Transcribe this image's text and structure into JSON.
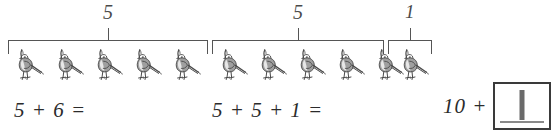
{
  "page": {
    "kind": "math-worksheet",
    "background_color": "#ffffff",
    "ink_color": "#3a3a3a"
  },
  "groups": [
    {
      "label": "5",
      "count": 5,
      "bracket": {
        "left": 8,
        "right": 208,
        "top": 40
      },
      "label_pos": {
        "x": 108,
        "y": 4
      }
    },
    {
      "label": "5",
      "count": 5,
      "bracket": {
        "left": 212,
        "right": 384,
        "top": 40
      },
      "label_pos": {
        "x": 298,
        "y": 4
      }
    },
    {
      "label": "1",
      "count": 1,
      "bracket": {
        "left": 388,
        "right": 431,
        "top": 40
      },
      "label_pos": {
        "x": 410,
        "y": 4
      }
    }
  ],
  "birds": {
    "icon": "quail-bird-icon",
    "total": 11,
    "body_color": "#8e8e8e",
    "outline_color": "#4a4a4a",
    "positions_x": [
      10,
      50,
      89,
      128,
      167,
      214,
      253,
      292,
      331,
      370,
      395
    ],
    "position_y": 48
  },
  "equations": [
    {
      "text": "5 + 6 =",
      "x": 14,
      "y": 100
    },
    {
      "text": "5 + 5 + 1 =",
      "x": 212,
      "y": 100
    },
    {
      "prefix": "10 +",
      "x": 443,
      "y": 84,
      "answer_value": "1",
      "answer_placeholder": ""
    }
  ]
}
